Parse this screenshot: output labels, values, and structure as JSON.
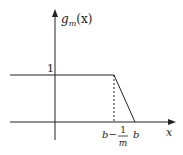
{
  "diagram": {
    "y_axis_label_main": "g",
    "y_axis_label_sub": "m",
    "y_axis_label_arg": "(x)",
    "x_axis_label": "x",
    "y_tick_label": "1",
    "x_tick_b_minus": "b−",
    "x_tick_frac_num": "1",
    "x_tick_frac_den": "m",
    "x_tick_b": "b",
    "line_color": "#222222"
  }
}
